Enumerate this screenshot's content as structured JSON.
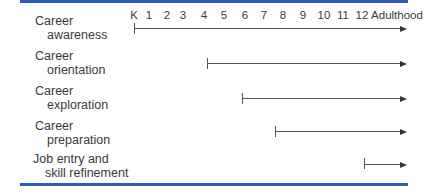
{
  "diagram": {
    "axis_labels": [
      "K",
      "1",
      "2",
      "3",
      "4",
      "5",
      "6",
      "7",
      "8",
      "9",
      "10",
      "11",
      "12",
      "Adulthood"
    ],
    "stages": [
      {
        "line1": "Career",
        "line2": "awareness",
        "start": "K",
        "end": "Adulthood"
      },
      {
        "line1": "Career",
        "line2": "orientation",
        "start": "4",
        "end": "Adulthood"
      },
      {
        "line1": "Career",
        "line2": "exploration",
        "start": "6",
        "end": "Adulthood"
      },
      {
        "line1": "Career",
        "line2": "preparation",
        "start": "8",
        "end": "Adulthood"
      },
      {
        "line1": "Job entry and",
        "line2": "skill refinement",
        "start": "12",
        "end": "Adulthood"
      }
    ],
    "colors": {
      "rule": "#2f5cb8",
      "line": "#555555",
      "text": "#3a3a3a"
    }
  }
}
